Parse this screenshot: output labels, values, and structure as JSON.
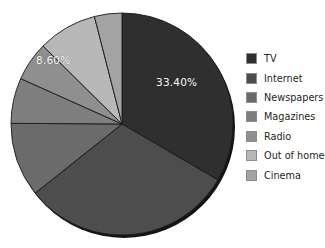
{
  "chart_data": {
    "type": "pie",
    "title": "",
    "categories": [
      "TV",
      "Internet",
      "Newspapers",
      "Magazines",
      "Radio",
      "Out of home",
      "Cinema"
    ],
    "values": [
      33.4,
      30.9,
      10.8,
      6.6,
      5.7,
      8.6,
      4.0
    ],
    "value_labels_shown": [
      "33.40%",
      "",
      "",
      "",
      "",
      "8.60%",
      ""
    ],
    "colors": [
      "#2f2f2f",
      "#4d4d4d",
      "#6b6b6b",
      "#7e7e7e",
      "#8f8f8f",
      "#b8b8b8",
      "#a3a3a3"
    ],
    "start_angle_deg": 0,
    "direction": "clockwise",
    "legend_position": "right",
    "grid": false,
    "xlabel": "",
    "ylabel": ""
  },
  "slice_labels": {
    "tv": "33.40%",
    "out_of_home": "8.60%"
  },
  "legend": {
    "items": [
      {
        "label": "TV",
        "color": "#2f2f2f"
      },
      {
        "label": "Internet",
        "color": "#4d4d4d"
      },
      {
        "label": "Newspapers",
        "color": "#6b6b6b"
      },
      {
        "label": "Magazines",
        "color": "#7e7e7e"
      },
      {
        "label": "Radio",
        "color": "#8f8f8f"
      },
      {
        "label": "Out of home",
        "color": "#b8b8b8"
      },
      {
        "label": "Cinema",
        "color": "#a3a3a3"
      }
    ]
  }
}
